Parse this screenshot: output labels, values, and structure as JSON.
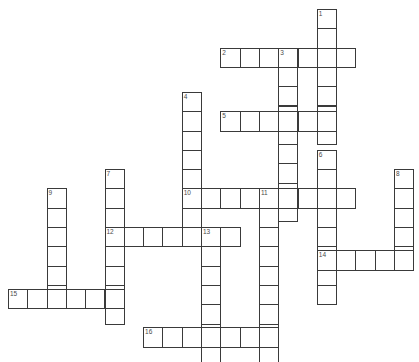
{
  "page": {
    "top_clipped_text": "",
    "background_color": "#ffffff",
    "cell_border_color": "#3a3a3a",
    "cell_fill_color": "#ffffff",
    "number_color": "#4a4a4a"
  },
  "grid": {
    "cell_size": 19.3,
    "origin_x": 8,
    "origin_y": 9,
    "columns": 22,
    "rows": 19
  },
  "entries": [
    {
      "number": "1",
      "direction": "down",
      "col": 16,
      "row": 0,
      "length": 7
    },
    {
      "number": "2",
      "direction": "across",
      "col": 11,
      "row": 2,
      "length": 7
    },
    {
      "number": "3",
      "direction": "down",
      "col": 14,
      "row": 2,
      "length": 9
    },
    {
      "number": "4",
      "direction": "down",
      "col": 9,
      "row": 4.3,
      "length": 8
    },
    {
      "number": "5",
      "direction": "across",
      "col": 11,
      "row": 5.3,
      "length": 6
    },
    {
      "number": "6",
      "direction": "down",
      "col": 16,
      "row": 7.3,
      "length": 8
    },
    {
      "number": "7",
      "direction": "down",
      "col": 5,
      "row": 8.3,
      "length": 8
    },
    {
      "number": "8",
      "direction": "down",
      "col": 20,
      "row": 8.3,
      "length": 5
    },
    {
      "number": "9",
      "direction": "down",
      "col": 2,
      "row": 9.3,
      "length": 6
    },
    {
      "number": "10",
      "direction": "across",
      "col": 9,
      "row": 9.3,
      "length": 9
    },
    {
      "number": "11",
      "direction": "down",
      "col": 13,
      "row": 9.3,
      "length": 9
    },
    {
      "number": "12",
      "direction": "across",
      "col": 5,
      "row": 11.3,
      "length": 7
    },
    {
      "number": "13",
      "direction": "down",
      "col": 10,
      "row": 11.3,
      "length": 7
    },
    {
      "number": "14",
      "direction": "across",
      "col": 16,
      "row": 12.5,
      "length": 5
    },
    {
      "number": "15",
      "direction": "across",
      "col": 0,
      "row": 14.5,
      "length": 6
    },
    {
      "number": "16",
      "direction": "across",
      "col": 7,
      "row": 16.5,
      "length": 7
    }
  ],
  "numbers_visible": [
    "1",
    "2",
    "3",
    "4",
    "5",
    "6",
    "7",
    "8",
    "9",
    "10",
    "11",
    "12",
    "13",
    "14",
    "15",
    "16"
  ]
}
